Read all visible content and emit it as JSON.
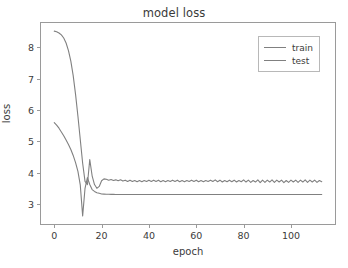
{
  "chart_data": {
    "type": "line",
    "title": "model loss",
    "xlabel": "epoch",
    "ylabel": "loss",
    "xlim": [
      -5.6,
      118.6
    ],
    "ylim": [
      2.36,
      8.78
    ],
    "grid": false,
    "legend_position": "upper right",
    "xticks": [
      0,
      20,
      40,
      60,
      80,
      100
    ],
    "xtick_labels": [
      "0",
      "20",
      "40",
      "60",
      "80",
      "100"
    ],
    "yticks": [
      3,
      4,
      5,
      6,
      7,
      8
    ],
    "ytick_labels": [
      "3",
      "4",
      "5",
      "6",
      "7",
      "8"
    ],
    "line_color": "#808080",
    "axes_color": "#9a9a9a",
    "background": "#ffffff",
    "x": [
      0,
      1,
      2,
      3,
      4,
      5,
      6,
      7,
      8,
      9,
      10,
      11,
      12,
      13,
      14,
      15,
      16,
      17,
      18,
      19,
      20,
      21,
      22,
      23,
      24,
      25,
      26,
      27,
      28,
      29,
      30,
      31,
      32,
      33,
      34,
      35,
      36,
      37,
      38,
      39,
      40,
      41,
      42,
      43,
      44,
      45,
      46,
      47,
      48,
      49,
      50,
      51,
      52,
      53,
      54,
      55,
      56,
      57,
      58,
      59,
      60,
      61,
      62,
      63,
      64,
      65,
      66,
      67,
      68,
      69,
      70,
      71,
      72,
      73,
      74,
      75,
      76,
      77,
      78,
      79,
      80,
      81,
      82,
      83,
      84,
      85,
      86,
      87,
      88,
      89,
      90,
      91,
      92,
      93,
      94,
      95,
      96,
      97,
      98,
      99,
      100,
      101,
      102,
      103,
      104,
      105,
      106,
      107,
      108,
      109,
      110,
      111,
      112,
      113
    ],
    "series": [
      {
        "name": "train",
        "color": "#808080",
        "values": [
          5.6,
          5.52,
          5.42,
          5.3,
          5.18,
          5.04,
          4.9,
          4.74,
          4.55,
          4.32,
          4.04,
          3.6,
          2.62,
          3.5,
          3.84,
          3.62,
          3.46,
          3.4,
          3.36,
          3.34,
          3.32,
          3.315,
          3.31,
          3.308,
          3.306,
          3.305,
          3.304,
          3.303,
          3.302,
          3.302,
          3.301,
          3.301,
          3.3,
          3.3,
          3.3,
          3.3,
          3.3,
          3.3,
          3.3,
          3.3,
          3.3,
          3.3,
          3.3,
          3.3,
          3.3,
          3.3,
          3.3,
          3.3,
          3.3,
          3.3,
          3.3,
          3.3,
          3.3,
          3.3,
          3.3,
          3.3,
          3.3,
          3.3,
          3.3,
          3.3,
          3.3,
          3.3,
          3.3,
          3.3,
          3.3,
          3.3,
          3.3,
          3.3,
          3.3,
          3.3,
          3.3,
          3.3,
          3.3,
          3.3,
          3.3,
          3.3,
          3.3,
          3.3,
          3.3,
          3.3,
          3.3,
          3.3,
          3.3,
          3.3,
          3.3,
          3.3,
          3.3,
          3.3,
          3.3,
          3.3,
          3.3,
          3.3,
          3.3,
          3.3,
          3.3,
          3.3,
          3.3,
          3.3,
          3.3,
          3.3,
          3.3,
          3.3,
          3.3,
          3.3,
          3.3,
          3.3,
          3.3,
          3.3,
          3.3,
          3.3,
          3.3,
          3.3,
          3.3,
          3.3
        ]
      },
      {
        "name": "test",
        "color": "#808080",
        "values": [
          8.52,
          8.5,
          8.46,
          8.4,
          8.3,
          8.14,
          7.9,
          7.56,
          7.1,
          6.5,
          5.8,
          5.05,
          4.3,
          3.72,
          3.62,
          4.42,
          3.9,
          3.62,
          3.5,
          3.56,
          3.74,
          3.8,
          3.79,
          3.76,
          3.78,
          3.75,
          3.77,
          3.74,
          3.77,
          3.73,
          3.76,
          3.72,
          3.76,
          3.72,
          3.75,
          3.71,
          3.75,
          3.71,
          3.75,
          3.72,
          3.76,
          3.72,
          3.76,
          3.72,
          3.76,
          3.71,
          3.75,
          3.71,
          3.75,
          3.72,
          3.76,
          3.72,
          3.76,
          3.71,
          3.75,
          3.71,
          3.75,
          3.72,
          3.76,
          3.72,
          3.76,
          3.71,
          3.75,
          3.71,
          3.75,
          3.72,
          3.76,
          3.72,
          3.77,
          3.71,
          3.76,
          3.7,
          3.75,
          3.71,
          3.76,
          3.71,
          3.76,
          3.7,
          3.75,
          3.71,
          3.77,
          3.7,
          3.76,
          3.69,
          3.75,
          3.7,
          3.77,
          3.68,
          3.76,
          3.69,
          3.76,
          3.7,
          3.77,
          3.69,
          3.76,
          3.7,
          3.76,
          3.68,
          3.75,
          3.69,
          3.76,
          3.7,
          3.76,
          3.69,
          3.76,
          3.7,
          3.77,
          3.69,
          3.76,
          3.7,
          3.76,
          3.69,
          3.75,
          3.71
        ]
      }
    ]
  },
  "legend": {
    "items": [
      {
        "label": "train"
      },
      {
        "label": "test"
      }
    ]
  }
}
